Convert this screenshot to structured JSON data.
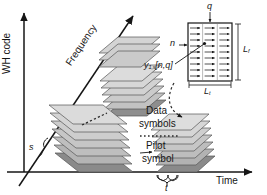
{
  "figure": {
    "type": "schematic-3d-resource-grid"
  },
  "axes": {
    "vertical": {
      "label": "WH code",
      "name": "wh-code-axis",
      "orientation": "up"
    },
    "diagonal": {
      "label": "Frequency",
      "name": "frequency-axis",
      "orientation": "up-right"
    },
    "horizontal": {
      "label": "Time",
      "name": "time-axis",
      "orientation": "right"
    }
  },
  "annotations": {
    "spreading_index": "s",
    "slot_duration": "t",
    "data_symbols": "Data\nsymbols",
    "data_symbols_line1": "Data",
    "data_symbols_line2": "symbols",
    "pilot_symbol_line1": "Pilot",
    "pilot_symbol_line2": "symbol"
  },
  "detail_box": {
    "name": "chip-detail-block",
    "top_label": "q",
    "left_label": "n",
    "signal_label_base": "y",
    "signal_label_sub": "1,s",
    "signal_label_index": "[n,q]",
    "width_label_base": "L",
    "width_label_sub": "t",
    "height_label_base": "L",
    "height_label_sub": "f",
    "grid_columns": 3,
    "grid_rows": 10
  },
  "stacks": [
    {
      "name": "upper-stack",
      "layers": 6,
      "has_pilot": true
    },
    {
      "name": "middle-stack",
      "layers": 7,
      "has_pilot": true
    },
    {
      "name": "right-stack",
      "layers": 6,
      "has_pilot": true
    }
  ],
  "colors": {
    "ink": "#161616",
    "slab_light": "#d7d7d7",
    "slab_mid": "#bdbdbd",
    "slab_dark": "#9a9a9a",
    "pilot": "#7c7c7c",
    "edge": "#555555",
    "dashed": "#3a3a3a"
  }
}
